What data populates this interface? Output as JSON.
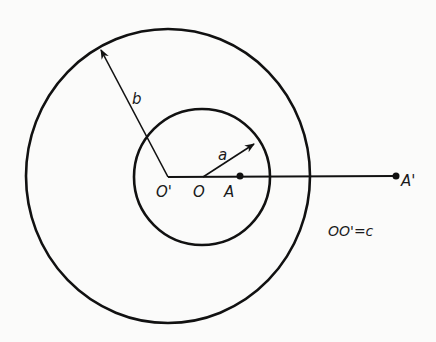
{
  "diagram": {
    "type": "geometry",
    "outer_circle": {
      "center_label": "O'",
      "radius_label": "b",
      "cx": 168,
      "cy": 176,
      "rx": 142,
      "ry": 147
    },
    "inner_circle": {
      "center_label": "O",
      "radius_label": "a",
      "cx": 202,
      "cy": 177,
      "r": 68
    },
    "labels": {
      "b": "b",
      "a": "a",
      "O_prime": "O'",
      "O": "O",
      "A": "A",
      "A_prime": "A'",
      "relation": "OO'=c"
    },
    "points": {
      "O_prime": [
        168,
        177
      ],
      "O": [
        203,
        177
      ],
      "A": [
        240,
        176
      ],
      "A_prime": [
        396,
        176
      ]
    },
    "colors": {
      "stroke": "#111111",
      "background": "#fbfbfa"
    }
  }
}
